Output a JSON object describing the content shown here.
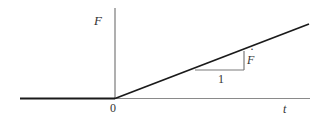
{
  "diagram": {
    "type": "ramp-function-plot",
    "labels": {
      "y_axis": "F",
      "x_axis": "t",
      "origin": "0",
      "run": "1",
      "rise": "F",
      "rise_dot": "·"
    },
    "colors": {
      "axis": "#7a7a7a",
      "curve": "#1a1a1a",
      "triangle": "#7a7a7a",
      "text": "#333333",
      "background": "#ffffff"
    }
  }
}
